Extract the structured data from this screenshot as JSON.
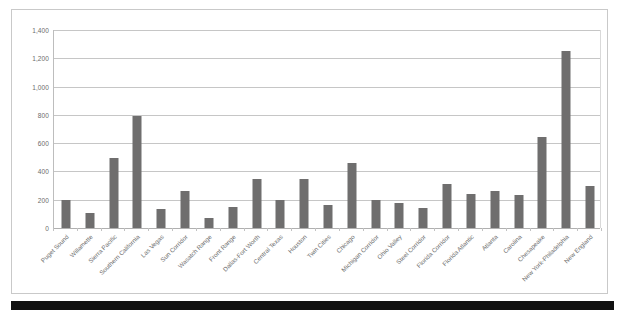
{
  "chart_data": {
    "type": "bar",
    "title": "",
    "subtitle": "",
    "xlabel": "",
    "ylabel": "",
    "ylim": [
      0,
      1400
    ],
    "ytick_values": [
      0,
      200,
      400,
      600,
      800,
      1000,
      1200,
      1400
    ],
    "ytick_labels": [
      "0",
      "200",
      "400",
      "600",
      "800",
      "1,000",
      "1,200",
      "1,400"
    ],
    "grid": "horizontal",
    "legend": "none",
    "bar_color": "#6f6e6e",
    "categories": [
      "Puget Sound",
      "Willamette",
      "Sierra Pacific",
      "Southern California",
      "Las Vegas",
      "Sun Corridor",
      "Wasatch Range",
      "Front Range",
      "Dallas-Fort Worth",
      "Central Texas",
      "Houston",
      "Twin Cities",
      "Chicago",
      "Michigan Corridor",
      "Ohio Valley",
      "Steel Corridor",
      "Florida Corridor",
      "Florida Atlantic",
      "Atlanta",
      "Carolina",
      "Chesapeake",
      "New York-Philadelphia",
      "New England"
    ],
    "values": [
      195,
      105,
      495,
      790,
      135,
      260,
      70,
      150,
      345,
      200,
      350,
      165,
      460,
      200,
      180,
      140,
      310,
      240,
      265,
      235,
      645,
      1255,
      300
    ]
  }
}
